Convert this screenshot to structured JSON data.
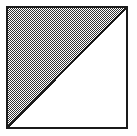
{
  "figure": {
    "name": "shaded-half-square",
    "description": "Square outline divided by a diagonal from the top-right corner to the bottom-left corner; the upper-left half is filled with a 50% checkerboard dither pattern and the lower-right half is blank white.",
    "canvas": {
      "width": 137,
      "height": 136,
      "background_color": "#fefefe"
    },
    "square": {
      "label": "square-outline",
      "left": 6,
      "top": 6,
      "right": 128,
      "bottom": 129,
      "width": 122,
      "height": 123,
      "stroke_color": "#1a1a1a",
      "stroke_width": 2,
      "fill_color": "#ffffff"
    },
    "diagonal": {
      "label": "diagonal-line",
      "from": "top-right",
      "to": "bottom-left",
      "x1": 127,
      "y1": 7,
      "x2": 7,
      "y2": 128,
      "stroke_color": "#1a1a1a",
      "stroke_width": 2
    },
    "shaded_region": {
      "label": "upper-left-triangle",
      "position": "upper-left",
      "fill_style": "checkerboard-dither-50",
      "pattern_cell_px": 1,
      "pattern_dark_color": "#333333",
      "pattern_light_color": "#ffffff",
      "vertices": [
        [
          7,
          7
        ],
        [
          127,
          7
        ],
        [
          7,
          128
        ]
      ]
    },
    "blank_region": {
      "label": "lower-right-triangle",
      "position": "lower-right",
      "fill_style": "solid",
      "fill_color": "#ffffff",
      "vertices": [
        [
          127,
          7
        ],
        [
          127,
          128
        ],
        [
          7,
          128
        ]
      ]
    }
  }
}
